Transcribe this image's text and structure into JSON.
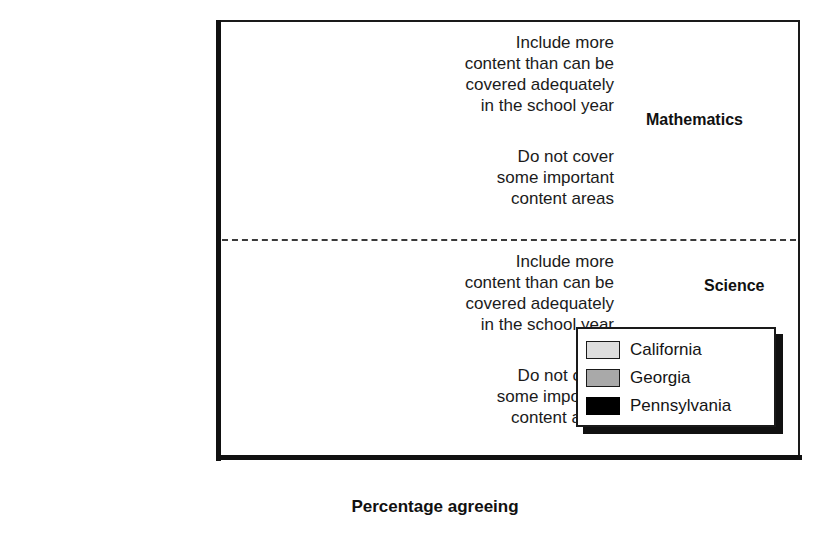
{
  "chart_data": {
    "type": "bar",
    "orientation": "horizontal",
    "title": "",
    "xlabel": "Percentage agreeing",
    "ylabel": "",
    "xlim": [
      0,
      100
    ],
    "xticks": [
      0,
      10,
      20,
      30,
      40,
      50,
      60,
      70,
      80,
      90,
      100
    ],
    "xtick_labels": [
      "0",
      "10",
      "20",
      "30",
      "40",
      "50",
      "60",
      "70",
      "80",
      "90",
      "100"
    ],
    "grid": false,
    "legend_position": "inside-lower-right",
    "sections": [
      {
        "name": "Mathematics",
        "categories": [
          "Include more\ncontent than can be\ncovered adequately\nin the school year",
          "Do not cover\nsome important\ncontent areas"
        ],
        "series": [
          {
            "name": "California",
            "values": [
              81,
              20
            ]
          },
          {
            "name": "Georgia",
            "values": [
              68,
              21
            ]
          },
          {
            "name": "Pennsylvania",
            "values": [
              64,
              22
            ]
          }
        ]
      },
      {
        "name": "Science",
        "categories": [
          "Include more\ncontent than can be\ncovered adequately\nin the school year",
          "Do not cover\nsome important\ncontent areas"
        ],
        "series": [
          {
            "name": "California",
            "values": [
              65,
              19
            ]
          },
          {
            "name": "Georgia",
            "values": [
              54,
              36
            ]
          },
          {
            "name": "Pennsylvania",
            "values": [
              55,
              22
            ]
          }
        ]
      }
    ],
    "series_colors": [
      "#dedede",
      "#a9a9a9",
      "#000000"
    ]
  },
  "legend": {
    "items": [
      {
        "label": "California"
      },
      {
        "label": "Georgia"
      },
      {
        "label": "Pennsylvania"
      }
    ]
  },
  "sections": {
    "math_label": "Mathematics",
    "science_label": "Science"
  },
  "categories": {
    "include_more": "Include more\ncontent than can be\ncovered adequately\nin the school year",
    "do_not_cover": "Do not cover\nsome important\ncontent areas"
  },
  "axis": {
    "title": "Percentage agreeing",
    "ticks": [
      "0",
      "10",
      "20",
      "30",
      "40",
      "50",
      "60",
      "70",
      "80",
      "90",
      "100"
    ]
  }
}
